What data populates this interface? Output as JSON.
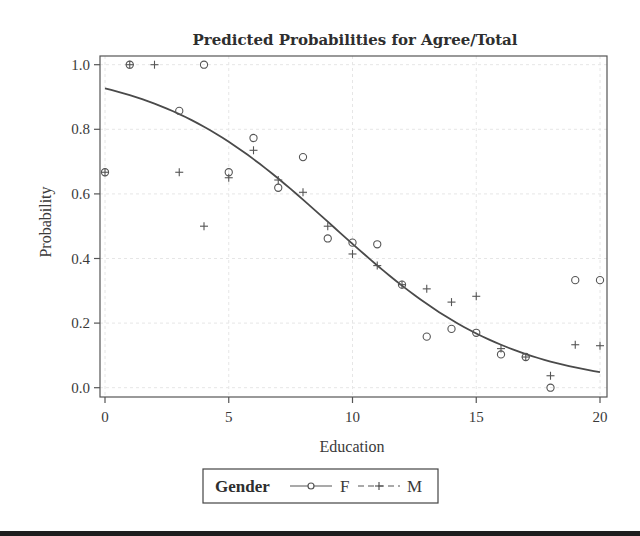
{
  "chart_data": {
    "type": "scatter",
    "title": "Predicted Probabilities for Agree/Total",
    "xlabel": "Education",
    "ylabel": "Probability",
    "xlim": [
      0,
      20
    ],
    "ylim": [
      0.0,
      1.0
    ],
    "x_ticks": [
      0,
      5,
      10,
      15,
      20
    ],
    "x_tick_labels": [
      "0",
      "5",
      "10",
      "15",
      "20"
    ],
    "y_ticks": [
      0.0,
      0.2,
      0.4,
      0.6,
      0.8,
      1.0
    ],
    "y_tick_labels": [
      "0.0",
      "0.2",
      "0.4",
      "0.6",
      "0.8",
      "1.0"
    ],
    "grid": true,
    "legend": {
      "position": "bottom",
      "title": "Gender",
      "entries": [
        {
          "label": "F",
          "marker": "circle",
          "line": "solid"
        },
        {
          "label": "M",
          "marker": "plus",
          "line": "dashed"
        }
      ]
    },
    "series": [
      {
        "name": "F",
        "marker": "circle",
        "x": [
          0,
          1,
          3,
          4,
          5,
          6,
          7,
          8,
          9,
          10,
          11,
          12,
          13,
          14,
          15,
          16,
          17,
          18,
          19,
          20
        ],
        "y": [
          0.667,
          1.0,
          0.857,
          1.0,
          0.667,
          0.773,
          0.619,
          0.714,
          0.462,
          0.449,
          0.444,
          0.319,
          0.158,
          0.182,
          0.17,
          0.103,
          0.095,
          0.0,
          0.333,
          0.333
        ]
      },
      {
        "name": "M",
        "marker": "plus",
        "x": [
          0,
          1,
          2,
          3,
          4,
          5,
          6,
          7,
          8,
          9,
          10,
          11,
          12,
          13,
          14,
          15,
          16,
          17,
          18,
          19,
          20
        ],
        "y": [
          0.667,
          1.0,
          1.0,
          0.667,
          0.5,
          0.65,
          0.735,
          0.643,
          0.605,
          0.5,
          0.414,
          0.378,
          0.319,
          0.306,
          0.265,
          0.283,
          0.121,
          0.095,
          0.037,
          0.133,
          0.13
        ]
      },
      {
        "name": "Predicted (fitted logistic curve)",
        "type": "line",
        "x": [
          0,
          2,
          4,
          6,
          8,
          9,
          10,
          12,
          14,
          16,
          18,
          20
        ],
        "y": [
          0.927,
          0.887,
          0.828,
          0.745,
          0.638,
          0.576,
          0.509,
          0.377,
          0.262,
          0.173,
          0.107,
          0.048
        ],
        "model": {
          "intercept": 2.54,
          "slope": -0.276
        }
      }
    ]
  },
  "colors": {
    "frame": "#555555",
    "curve": "#4a4a4a",
    "marker": "#555555",
    "grid": "#e6e6e6",
    "text": "#3a3a3a",
    "bottom_bar": "#1e1e1e"
  }
}
